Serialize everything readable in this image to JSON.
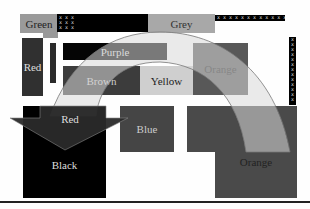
{
  "diagram": {
    "type": "grayscale color-block layout with overlaid arc band and arrow",
    "colors": {
      "background": "#fefefe",
      "green": "#9a9a9a",
      "grey": "#a8a8a8",
      "red_left": "#303030",
      "purple": "#050505",
      "brown": "#3c3c3c",
      "yellow": "#cfcfcf",
      "orange_top": "#585858",
      "black": "#000000",
      "red_arrow": "#2a2a2a",
      "blue": "#454545",
      "orange_bottom": "#4a4a4a",
      "arc_band": "#d9d9d9",
      "arc_stroke": "#777777",
      "rule": "#222222"
    },
    "blocks": [
      {
        "id": "green",
        "label": "Green"
      },
      {
        "id": "grey",
        "label": "Grey"
      },
      {
        "id": "red-left",
        "label": "Red"
      },
      {
        "id": "purple",
        "label": "Purple"
      },
      {
        "id": "brown",
        "label": "Brown"
      },
      {
        "id": "yellow",
        "label": "Yellow"
      },
      {
        "id": "orange-top",
        "label": "Orange"
      },
      {
        "id": "red-arrow",
        "label": "Red"
      },
      {
        "id": "black",
        "label": "Black"
      },
      {
        "id": "blue",
        "label": "Blue"
      },
      {
        "id": "orange-bottom",
        "label": "Orange"
      }
    ],
    "patterns": {
      "x_grid_small": "x x x\nx x x\nx x x",
      "x_row_top": "x x x x x x x x x x x x",
      "x_column_right": "x\nx\nx\nx\nx\nx\nx\nx\nx\nx\nx\nx\nx"
    }
  }
}
